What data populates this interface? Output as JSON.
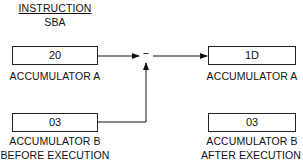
{
  "instruction": {
    "heading": "INSTRUCTION",
    "mnemonic": "SBA"
  },
  "before": {
    "caption": "BEFORE EXECUTION",
    "accumulator_a": {
      "label": "ACCUMULATOR A",
      "value": "20"
    },
    "accumulator_b": {
      "label": "ACCUMULATOR B",
      "value": "03"
    }
  },
  "operation": {
    "symbol": "−",
    "name": "subtract"
  },
  "after": {
    "caption": "AFTER EXECUTION",
    "accumulator_a": {
      "label": "ACCUMULATOR A",
      "value": "1D"
    },
    "accumulator_b": {
      "label": "ACCUMULATOR B",
      "value": "03"
    }
  }
}
